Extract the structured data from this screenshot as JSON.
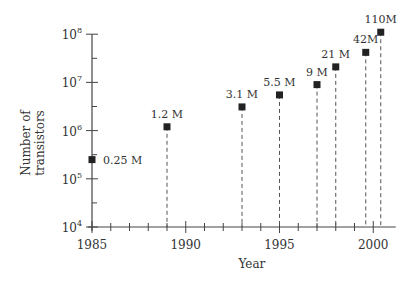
{
  "chart_data": {
    "type": "scatter",
    "title": "",
    "xlabel": "Year",
    "ylabel": "Number of transistors",
    "ylabel_lines": [
      "Number of",
      "transistors"
    ],
    "yscale": "log",
    "xlim": [
      1985,
      2001.2
    ],
    "ylim": [
      10000,
      100000000
    ],
    "grid": false,
    "x_ticks": [
      1985,
      1990,
      1995,
      2000
    ],
    "x_tick_labels": [
      "1985",
      "1990",
      "1995",
      "2000"
    ],
    "y_ticks": [
      10000,
      100000,
      1000000,
      10000000,
      100000000
    ],
    "y_tick_labels": [
      {
        "base": "10",
        "exp": "4"
      },
      {
        "base": "10",
        "exp": "5"
      },
      {
        "base": "10",
        "exp": "6"
      },
      {
        "base": "10",
        "exp": "7"
      },
      {
        "base": "10",
        "exp": "8"
      }
    ],
    "points": [
      {
        "x": 1985,
        "y": 250000,
        "label": "0.25 M",
        "label_pos": "right"
      },
      {
        "x": 1989,
        "y": 1200000,
        "label": "1.2 M",
        "label_pos": "above"
      },
      {
        "x": 1993,
        "y": 3100000,
        "label": "3.1 M",
        "label_pos": "above"
      },
      {
        "x": 1995,
        "y": 5500000,
        "label": "5.5 M",
        "label_pos": "above"
      },
      {
        "x": 1997,
        "y": 9000000,
        "label": "9 M",
        "label_pos": "above"
      },
      {
        "x": 1998,
        "y": 21000000,
        "label": "21 M",
        "label_pos": "above"
      },
      {
        "x": 1999.6,
        "y": 42000000,
        "label": "42M",
        "label_pos": "above"
      },
      {
        "x": 2000.4,
        "y": 110000000,
        "label": "110M",
        "label_pos": "above"
      }
    ],
    "marker": "square",
    "drop_lines": "dashed",
    "color": "#222222"
  }
}
